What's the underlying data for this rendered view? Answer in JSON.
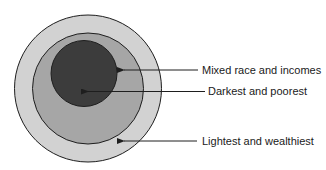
{
  "diagram": {
    "type": "nested-circles",
    "circles": [
      {
        "name": "outer",
        "cx": 88,
        "cy": 88.5,
        "r": 73.5,
        "fill": "#d2d2d2"
      },
      {
        "name": "middle",
        "cx": 88,
        "cy": 88.5,
        "r": 55.5,
        "fill": "#a6a6a6"
      },
      {
        "name": "inner",
        "cx": 84,
        "cy": 73.5,
        "r": 33,
        "fill": "#3c3c3c"
      }
    ],
    "stroke": "#1e1e1e",
    "labels": [
      {
        "text": "Mixed race and incomes",
        "x": 202,
        "y": 64,
        "arrow": {
          "x1": 198,
          "y1": 70,
          "x2": 124,
          "y2": 70
        }
      },
      {
        "text": "Darkest and poorest",
        "x": 208,
        "y": 85,
        "arrow": {
          "x1": 205,
          "y1": 91.5,
          "x2": 88,
          "y2": 91.5
        }
      },
      {
        "text": "Lightest and wealthiest",
        "x": 202,
        "y": 135,
        "arrow": {
          "x1": 197,
          "y1": 141,
          "x2": 124,
          "y2": 141
        }
      }
    ]
  }
}
